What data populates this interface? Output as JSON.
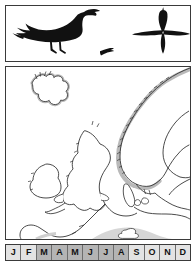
{
  "page": {
    "kind": "bird-field-guide-species-page",
    "background": "#ffffff"
  },
  "silhouette_panel": {
    "left_panel": {
      "label": "perched-cormorant-silhouette",
      "description": "Black silhouette of a perched cormorant standing with upright neck and hooked bill, body angled down to the left, long tail",
      "secondary_label": "distant-flight-silhouette",
      "secondary_description": "Small black silhouette of the same bird in distant low flight",
      "fill_color": "#111111"
    },
    "right_panel": {
      "label": "flight-silhouette-from-below",
      "description": "Black cross-shaped flight silhouette seen from below: long neck extended forward, long tail, wings held straight out",
      "fill_color": "#111111"
    }
  },
  "map": {
    "title": "distribution-map-northern-europe",
    "regions": [
      "Iceland",
      "Scandinavia",
      "British Isles",
      "Ireland",
      "France",
      "Denmark",
      "Baltic",
      "Finland",
      "Iberian coast"
    ],
    "range_shading_color": "#b9b9b9",
    "coastline_color": "#2b2b2b",
    "water_color": "#ffffff",
    "land_color": "#ffffff",
    "legend_note": "Grey band along coastlines indicates the species range"
  },
  "phenology": {
    "label": "monthly-occurrence-bar",
    "shaded_color": "#b4b4b4",
    "unshaded_color": "#e3e3e3",
    "months": [
      {
        "label": "J",
        "name": "January",
        "shaded": false
      },
      {
        "label": "F",
        "name": "February",
        "shaded": false
      },
      {
        "label": "M",
        "name": "March",
        "shaded": true
      },
      {
        "label": "A",
        "name": "April",
        "shaded": true
      },
      {
        "label": "M",
        "name": "May",
        "shaded": true
      },
      {
        "label": "J",
        "name": "June",
        "shaded": true
      },
      {
        "label": "J",
        "name": "July",
        "shaded": true
      },
      {
        "label": "A",
        "name": "August",
        "shaded": true
      },
      {
        "label": "S",
        "name": "September",
        "shaded": false
      },
      {
        "label": "O",
        "name": "October",
        "shaded": false
      },
      {
        "label": "N",
        "name": "November",
        "shaded": false
      },
      {
        "label": "D",
        "name": "December",
        "shaded": false
      }
    ]
  }
}
